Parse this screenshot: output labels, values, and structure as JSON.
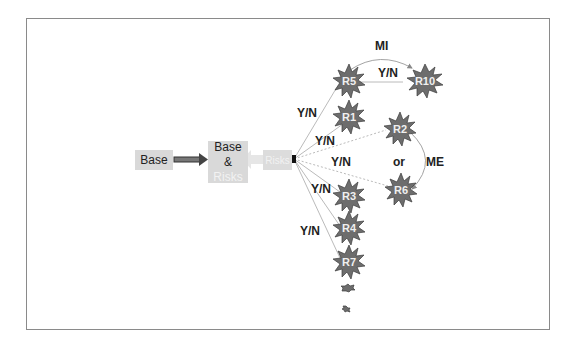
{
  "nodes": {
    "base": {
      "label": "Base"
    },
    "base_risks": {
      "line1": "Base",
      "line2": "&",
      "line3": "Risks"
    },
    "risks": {
      "label": "Risks"
    }
  },
  "risks": [
    {
      "id": "R5",
      "label": "R5"
    },
    {
      "id": "R10",
      "label": "R10"
    },
    {
      "id": "R1",
      "label": "R1"
    },
    {
      "id": "R2",
      "label": "R2"
    },
    {
      "id": "R6",
      "label": "R6"
    },
    {
      "id": "R3",
      "label": "R3"
    },
    {
      "id": "R4",
      "label": "R4"
    },
    {
      "id": "R7",
      "label": "R7"
    }
  ],
  "edge_labels": {
    "mi": "MI",
    "r5_r10": "Y/N",
    "to_r5": "Y/N",
    "to_r1": "Y/N",
    "to_r2_r6": "Y/N",
    "to_r3": "Y/N",
    "to_r4_r7": "Y/N",
    "or": "or",
    "me": "ME"
  },
  "colors": {
    "box_fill": "#d9d9d9",
    "risk_fill": "#6d6d6d",
    "line": "#9a9a9a",
    "arrow_dark": "#555555"
  }
}
